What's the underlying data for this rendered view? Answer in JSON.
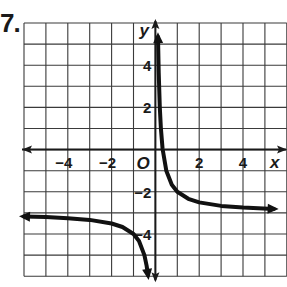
{
  "problem": {
    "number": "7."
  },
  "chart_data": {
    "type": "line",
    "title": "",
    "function": "y = 1/x - 3",
    "xlabel": "x",
    "ylabel": "y",
    "origin_label": "O",
    "xlim": [
      -6,
      6
    ],
    "ylim": [
      -6,
      6
    ],
    "grid": true,
    "x_ticks": [
      {
        "value": -4,
        "label": "−4"
      },
      {
        "value": -2,
        "label": "−2"
      },
      {
        "value": 2,
        "label": "2"
      },
      {
        "value": 4,
        "label": "4"
      }
    ],
    "y_ticks": [
      {
        "value": 4,
        "label": "4"
      },
      {
        "value": 2,
        "label": "2"
      },
      {
        "value": -2,
        "label": "−2"
      },
      {
        "value": -4,
        "label": "−4"
      }
    ],
    "asymptotes": {
      "vertical": 0,
      "horizontal": -3
    },
    "series": [
      {
        "name": "right-branch",
        "x": [
          0.12,
          0.15,
          0.2,
          0.25,
          0.33,
          0.5,
          0.75,
          1,
          1.5,
          2,
          3,
          4,
          5.4
        ],
        "y": [
          5.33,
          3.67,
          2.0,
          1.0,
          0.03,
          -1.0,
          -1.67,
          -2.0,
          -2.33,
          -2.5,
          -2.67,
          -2.75,
          -2.81
        ]
      },
      {
        "name": "left-branch",
        "x": [
          -6,
          -5,
          -4,
          -3,
          -2,
          -1.5,
          -1,
          -0.75,
          -0.5,
          -0.4,
          -0.34
        ],
        "y": [
          -3.17,
          -3.2,
          -3.25,
          -3.33,
          -3.5,
          -3.67,
          -4.0,
          -4.33,
          -5.0,
          -5.5,
          -5.94
        ]
      }
    ],
    "colors": {
      "grid": "#3a3a3a",
      "axis": "#1a1a1a",
      "curve": "#111111"
    }
  }
}
